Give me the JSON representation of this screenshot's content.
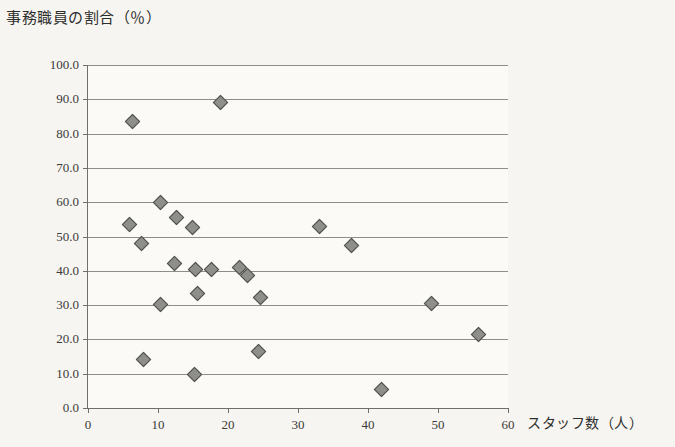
{
  "chart_data": {
    "type": "scatter",
    "title": "事務職員の割合（％）",
    "xlabel": "スタッフ数（人）",
    "ylabel": "事務職員の割合（％）",
    "xlim": [
      0,
      60
    ],
    "ylim": [
      0,
      100
    ],
    "grid": true,
    "legend": null,
    "x_ticks": [
      "0",
      "10",
      "20",
      "30",
      "40",
      "50",
      "60"
    ],
    "x_tick_values": [
      0,
      10,
      20,
      30,
      40,
      50,
      60
    ],
    "y_ticks": [
      "0.0",
      "10.0",
      "20.0",
      "30.0",
      "40.0",
      "50.0",
      "60.0",
      "70.0",
      "80.0",
      "90.0",
      "100.0"
    ],
    "y_tick_values": [
      0,
      10,
      20,
      30,
      40,
      50,
      60,
      70,
      80,
      90,
      100
    ],
    "marker": "diamond",
    "marker_color": "#8e8e8a",
    "marker_edge_color": "#4d4d4a",
    "points": [
      {
        "x": 6.3,
        "y": 83.5
      },
      {
        "x": 18.9,
        "y": 89.0
      },
      {
        "x": 5.9,
        "y": 53.5
      },
      {
        "x": 7.6,
        "y": 48.0
      },
      {
        "x": 10.3,
        "y": 60.0
      },
      {
        "x": 12.7,
        "y": 55.5
      },
      {
        "x": 14.9,
        "y": 52.5
      },
      {
        "x": 12.3,
        "y": 42.0
      },
      {
        "x": 15.4,
        "y": 40.5
      },
      {
        "x": 17.7,
        "y": 40.3
      },
      {
        "x": 15.6,
        "y": 33.5
      },
      {
        "x": 10.4,
        "y": 30.3
      },
      {
        "x": 21.6,
        "y": 41.0
      },
      {
        "x": 22.8,
        "y": 38.5
      },
      {
        "x": 24.6,
        "y": 32.2
      },
      {
        "x": 33.0,
        "y": 53.0
      },
      {
        "x": 37.6,
        "y": 47.5
      },
      {
        "x": 49.0,
        "y": 30.5
      },
      {
        "x": 55.8,
        "y": 21.5
      },
      {
        "x": 7.9,
        "y": 14.2
      },
      {
        "x": 15.2,
        "y": 9.7
      },
      {
        "x": 24.4,
        "y": 16.5
      },
      {
        "x": 41.9,
        "y": 5.5
      }
    ]
  },
  "colors": {
    "background": "#f7f5f1",
    "plot_background": "#fbfaf7",
    "gridline": "#8d8d89",
    "axis": "#6e6e6a",
    "text": "#3a3a38"
  }
}
